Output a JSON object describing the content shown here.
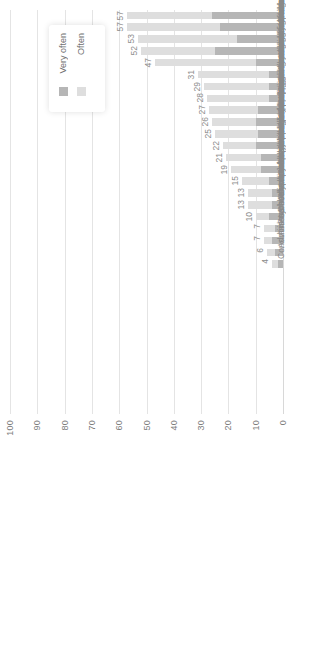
{
  "chart_data": {
    "type": "bar",
    "orientation": "rotated-vertical-stacked",
    "title": "",
    "xlabel": "",
    "ylabel": "",
    "ylim": [
      0,
      100
    ],
    "grid": true,
    "legend_position": "top-left",
    "stacked": true,
    "tick_labels": [
      "0",
      "10",
      "20",
      "30",
      "40",
      "50",
      "60",
      "70",
      "80",
      "90",
      "100"
    ],
    "tick_values": [
      0,
      10,
      20,
      30,
      40,
      50,
      60,
      70,
      80,
      90,
      100
    ],
    "categories": [
      "Use BHDP",
      "Triage walk-in patients",
      "Risk assessments",
      "Administer/score symptom measures",
      "Intake interviews",
      "Psychoeducational groups",
      "Conduct behavioral health outreach",
      "Case management",
      "Supportive counseling for mental health concerns",
      "Supportive counseling for substance use",
      "Group counseling sessions",
      "Conduct prevention/outreach",
      "Monitor patient progress using symptom measures",
      "Review patient homework",
      "Combat stress interventions",
      "Administer/score psychological tests",
      "Psychotherapy for substance use disorders",
      "Develop treatment plans",
      "Psychotherapy for mental health",
      "Assess medication adherence/side effects",
      "Administer/score neuropsychological tests",
      "Consult in non-behavioral health clinical settings"
    ],
    "totals": [
      57,
      57,
      53,
      52,
      47,
      31,
      29,
      28,
      27,
      26,
      25,
      22,
      21,
      19,
      15,
      13,
      13,
      10,
      7,
      7,
      6,
      4
    ],
    "series": [
      {
        "name": "Very often",
        "color": "#b6b6b6",
        "values": [
          26,
          23,
          17,
          25,
          10,
          5,
          5,
          5,
          9,
          10,
          9,
          10,
          8,
          8,
          5,
          4,
          4,
          5,
          3,
          4,
          3,
          2
        ]
      },
      {
        "name": "Often",
        "color": "#dedede",
        "values": [
          31,
          34,
          36,
          27,
          37,
          26,
          24,
          23,
          18,
          16,
          16,
          12,
          13,
          11,
          10,
          9,
          9,
          5,
          4,
          3,
          3,
          2
        ]
      }
    ]
  },
  "legend": {
    "items": [
      {
        "label": "Very often",
        "color": "#b6b6b6"
      },
      {
        "label": "Often",
        "color": "#dedede"
      }
    ]
  }
}
